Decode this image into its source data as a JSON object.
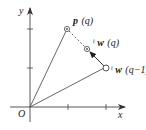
{
  "diagram": {
    "type": "vector-update",
    "axes": {
      "x_label": "x",
      "y_label": "y",
      "origin_label": "O"
    },
    "points": [
      {
        "id": "p_q",
        "vec": "p",
        "arg": "(q)",
        "prefix": ""
      },
      {
        "id": "w_q",
        "vec": "w",
        "arg": "(q)",
        "prefix": "ᵢ"
      },
      {
        "id": "w_q_minus_1",
        "vec": "w",
        "arg": "(q−1)",
        "prefix": "ᵢ"
      }
    ],
    "labels": {
      "p_q_vec": "p",
      "p_q_arg": "(q)",
      "w_q_pre": "i",
      "w_q_vec": "w",
      "w_q_arg": "(q)",
      "w_qm1_pre": "i",
      "w_qm1_vec": "w",
      "w_qm1_arg": "(q−1)"
    },
    "colors": {
      "line": "#555555",
      "text": "#222222"
    }
  }
}
